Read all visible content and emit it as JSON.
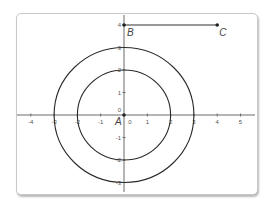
{
  "diagram": {
    "type": "coordinate-plane",
    "origin_px": [
      124,
      115
    ],
    "unit_px": [
      23.3,
      22.5
    ],
    "x_ticks": [
      {
        "value": -4,
        "label": "-4"
      },
      {
        "value": -3,
        "label": "-3"
      },
      {
        "value": -2,
        "label": "-2"
      },
      {
        "value": -1,
        "label": "-1"
      },
      {
        "value": 1,
        "label": "1"
      },
      {
        "value": 2,
        "label": "2"
      },
      {
        "value": 3,
        "label": "3"
      },
      {
        "value": 4,
        "label": "4"
      },
      {
        "value": 5,
        "label": "5"
      }
    ],
    "x_zero_label": "0",
    "y_ticks": [
      {
        "value": 4,
        "label": "4"
      },
      {
        "value": 3,
        "label": "3"
      },
      {
        "value": 2,
        "label": "2"
      },
      {
        "value": 1,
        "label": "1"
      },
      {
        "value": -1,
        "label": "-1"
      },
      {
        "value": -2,
        "label": "-2"
      },
      {
        "value": -3,
        "label": "-3"
      }
    ],
    "y_zero_label": "0",
    "circles": [
      {
        "center": "A",
        "radius": 2
      },
      {
        "center": "A",
        "radius": 3
      }
    ],
    "points": [
      {
        "name": "A",
        "label": "A",
        "x": 0,
        "y": 0
      },
      {
        "name": "B",
        "label": "B",
        "x": 0,
        "y": 4
      },
      {
        "name": "C",
        "label": "C",
        "x": 4,
        "y": 4
      }
    ],
    "segments": [
      {
        "from": "B",
        "to": "C"
      }
    ],
    "colors": {
      "curve": "#2a2a2a",
      "axis": "#6a6a6a",
      "label": "#444444"
    }
  }
}
